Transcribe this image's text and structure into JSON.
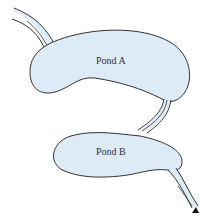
{
  "diagram": {
    "ponds": [
      {
        "id": "pond-a",
        "label": "Pond A"
      },
      {
        "id": "pond-b",
        "label": "Pond B"
      }
    ],
    "flows": [
      {
        "from": "inflow",
        "to": "pond-a"
      },
      {
        "from": "pond-a",
        "to": "pond-b"
      },
      {
        "from": "pond-b",
        "to": "outflow"
      }
    ],
    "colors": {
      "water": "#dcebf5",
      "outline": "#333333"
    }
  }
}
